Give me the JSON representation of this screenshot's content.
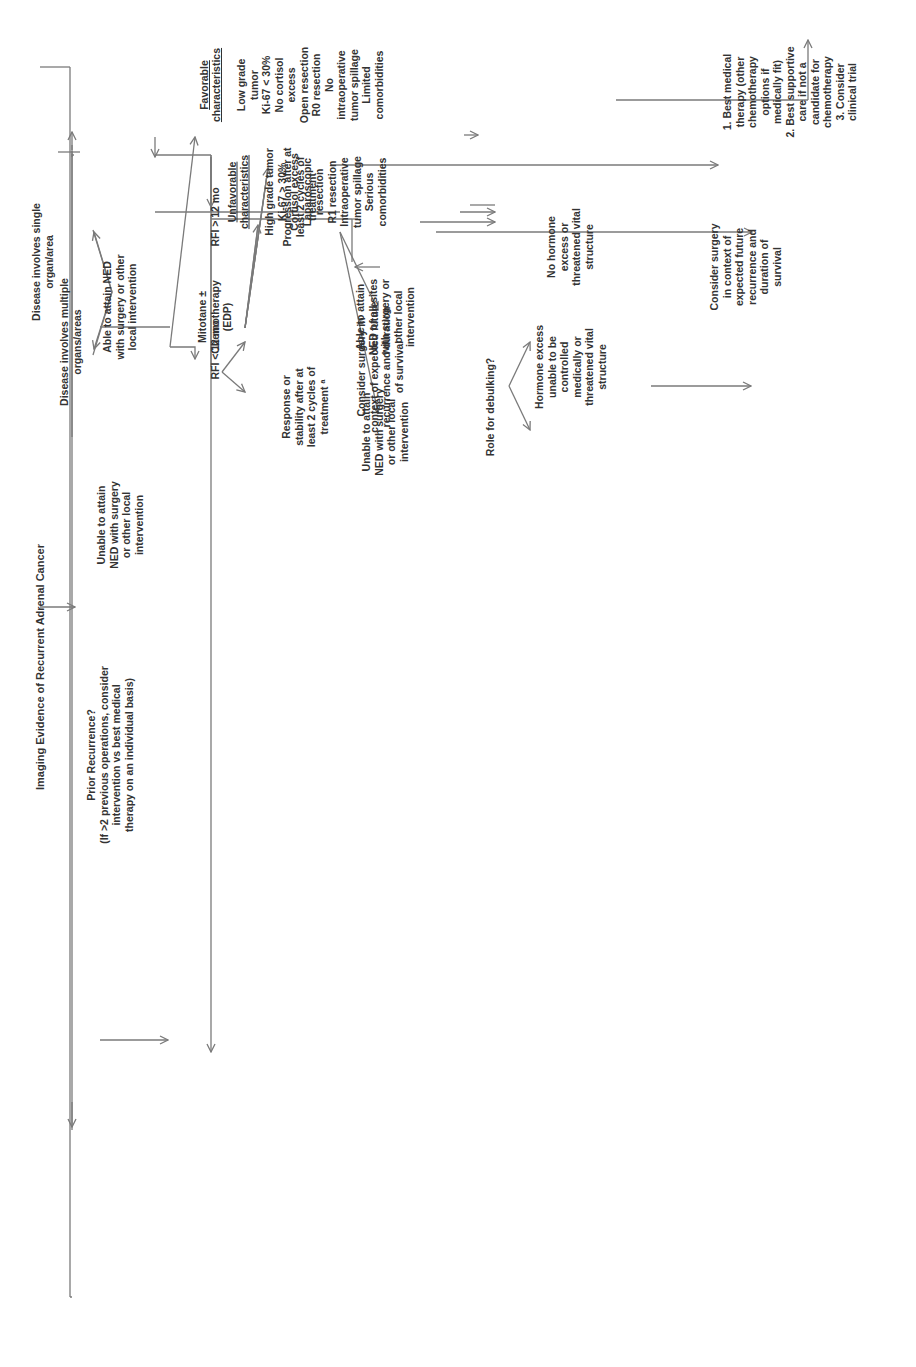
{
  "title": "Imaging Evidence of Recurrent Adrenal Cancer",
  "nodes": {
    "single": "Disease involves single\norgan/area",
    "prior": "Prior Recurrence?\n(If >2 previous operations, consider\nintervention  vs  best medical\ntherapy on an individual basis)",
    "multiple": "Disease involves multiple\norgans/areas",
    "able_ned": "Able to attain NED\nwith surgery or other\nlocal intervention",
    "unable_ned": "Unable to attain\nNED with surgery\nor other local\nintervention",
    "rfi_gt": "RFI > 12 mo",
    "rfi_lt": "RFI < 12 mo",
    "mitotane": "Mitotane ±\nChemotherapy\n(EDP)",
    "progression": "Progression after at\nleast 2 cycles of\ntreatment",
    "response": "Response or\nstability after at\nleast 2 cycles of\ntreatment ᵃ",
    "able_all": "Able to attain\nNED of all sites\nwith surgery or\nother local\nintervention",
    "unable_ned2": "Unable to attain\nNED with surgery\nor other local\nintervention",
    "debulking": "Role for debulking?",
    "hormone_excess": "Hormone excess\nunable to be\ncontrolled\nmedically or\nthreatened vital\nstructure",
    "no_hormone": "No hormone\nexcess or\nthreatened vital\nstructure",
    "consider_surgery_right": "Consider surgery\nin context of\nexpected future\nrecurrence and\nduration of\nsurvival",
    "best_medical": "1. Best medical\ntherapy (other\nchemotherapy\noptions if\nmedically fit)\n2. Best supportive\ncare if not a\ncandidate for\nchemotherapy\n3. Consider\nclinical trial",
    "consider_surgery_left": "Consider surgery in\ncontext of expected future\nrecurrence and duration\nof survival",
    "favorable_heading": "Favorable\ncharacteristics",
    "favorable_items": "Low grade tumor\nKi-67 < 30%\nNo cortisol excess\nOpen resection\nR0 resection\nNo intraoperative\ntumor spillage\nLimited\ncomorbidities",
    "unfavorable_heading": "Unfavorable\ncharacteristics",
    "unfavorable_items": "High grade tumor\nKi-67 > 30%\nCortisol excess\nLaparoscopic\nresection\nR1 resection\nIntraoperative\ntumor spillage\nSerious\ncomorbidities"
  },
  "table": {
    "lung": {
      "heading": "Lung",
      "le3_heading": "≤3\nmetastases",
      "le3_text": "Surgery vs.\nother local\ntissue\nsparing\ntherapy\n(SBRT, RFA,\nMWA\ncryoablation,\netc.)",
      "gt3_heading": ">3\nmetastases",
      "gt3_text": "Best medical\ntherapy"
    },
    "liver": {
      "heading": "Liver",
      "single_lobe_heading": "Single lobe",
      "le3cm_heading": "≤3 cm",
      "le3cm_text": "Image guided\nintervention\n(RFA, MWA,\nSBRT,\ncryoablation,\netc.)",
      "gt3cm_heading": ">3 cm",
      "gt3cm_text": "Formal\nsurgical\nresection ±\nimage guided\nintervention\nif other\nsmaller sites",
      "both_lobes_heading": "Both lobes",
      "both_lobes_text": "Combination\nof formal vs.\ntissue sparing\nsurgical\nresection ±\nimage guided\nintervention\ndepending on\nsize and\ndistribution\nof metastatic\ndisease\nOR\nBest medical\ntherapy"
    },
    "tumor_bed": {
      "heading": "Tumor Bed",
      "text": "1. Remove\nremaining\nretroperitoneal\nfat in area\n2. Consider\nXRT after\nsurgery if not\nalready done"
    },
    "peritoneal": {
      "heading": "Peritoneal\nCavity",
      "text": "1. Resection\nof all visible\ndisease.\n2. Consider\nHIPEC\nunder study\nprotocol"
    },
    "other": {
      "heading": "Other",
      "text": "Site\nDependent"
    }
  },
  "colors": {
    "line": "#7a7a7a",
    "text": "#333333",
    "box_border": "#555555",
    "background": "#ffffff"
  }
}
